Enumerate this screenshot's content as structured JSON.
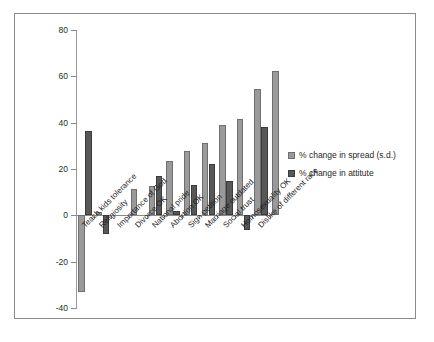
{
  "chart_data": {
    "type": "bar",
    "title": "",
    "subtitle": "",
    "xlabel": "",
    "ylabel": "",
    "ylim": [
      -40,
      80
    ],
    "yticks": [
      80,
      60,
      40,
      20,
      0,
      -20,
      -40
    ],
    "ytick_labels": [
      "80",
      "60",
      "40",
      "20",
      "0",
      "-20",
      "-40"
    ],
    "grid": false,
    "legend_position": "right",
    "categories": [
      "Teach kids tolerance",
      "Religiosity",
      "Importance of God",
      "Divorce OK",
      "National pride",
      "Abortion OK",
      "Sign petition",
      "Marriage outdated",
      "Social trust",
      "Homosexuality OK",
      "Dislike of different race"
    ],
    "series": [
      {
        "name": "% change in spread (s.d.)",
        "color": "#9a9a9a",
        "values": [
          -33.0,
          1.5,
          0.0,
          11.5,
          12.7,
          23.5,
          27.8,
          31.3,
          39.2,
          41.6,
          54.4
        ]
      },
      {
        "name": "% change in attitute",
        "color": "#585858",
        "values": [
          36.5,
          -8.0,
          0.0,
          0.0,
          17.0,
          1.9,
          13.0,
          22.3,
          15.0,
          -6.3,
          38.2
        ]
      }
    ],
    "extra_bar": {
      "note": "final light bar",
      "value": 62.4
    }
  },
  "legend": {
    "items": [
      {
        "label": "% change in spread (s.d.)",
        "swatch": "spread"
      },
      {
        "label": "% change in attitute",
        "swatch": "attitute"
      }
    ]
  }
}
